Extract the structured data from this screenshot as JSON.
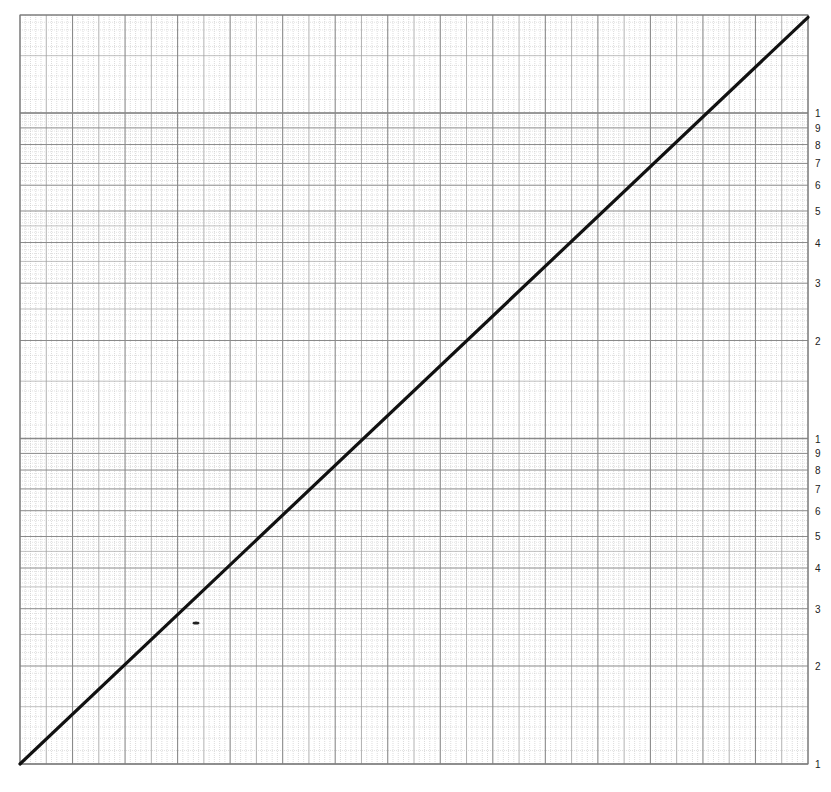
{
  "chart_data": {
    "type": "line",
    "title": "",
    "xlabel": "",
    "ylabel": "",
    "x_scale": "linear",
    "y_scale": "log",
    "grid": true,
    "legend": "none",
    "x_major_divisions": 15,
    "x_minor_per_major": 10,
    "y_cycles_full": 2,
    "y_partial_top_cycle_max": 1.97,
    "y_tick_labels": {
      "cycle_1": [
        "1",
        "2",
        "3",
        "4",
        "5",
        "6",
        "7",
        "8",
        "9",
        "1"
      ],
      "cycle_2": [
        "2",
        "3",
        "4",
        "5",
        "6",
        "7",
        "8",
        "9",
        "1"
      ]
    },
    "series": [
      {
        "name": "straight line",
        "x": [
          0,
          15
        ],
        "y_log_decades": [
          0,
          2.294
        ],
        "y": [
          1,
          196.8
        ],
        "color": "#111111"
      }
    ],
    "annotations": [
      {
        "type": "stray-mark",
        "x_px": 196,
        "y_px": 623
      }
    ]
  },
  "plot": {
    "left": 20,
    "right": 808,
    "top": 15,
    "bottom": 764,
    "cycle_height": 325.5,
    "grid_color_major": "#8a8a8a",
    "grid_color_minor": "#c4c4c4",
    "line_color": "#111111"
  },
  "labels": {
    "right_axis": [
      {
        "text": "1",
        "value": 1,
        "cycle": 0
      },
      {
        "text": "2",
        "value": 2,
        "cycle": 0
      },
      {
        "text": "3",
        "value": 3,
        "cycle": 0
      },
      {
        "text": "4",
        "value": 4,
        "cycle": 0
      },
      {
        "text": "5",
        "value": 5,
        "cycle": 0
      },
      {
        "text": "6",
        "value": 6,
        "cycle": 0
      },
      {
        "text": "7",
        "value": 7,
        "cycle": 0
      },
      {
        "text": "8",
        "value": 8,
        "cycle": 0
      },
      {
        "text": "9",
        "value": 9,
        "cycle": 0
      },
      {
        "text": "1",
        "value": 1,
        "cycle": 1
      },
      {
        "text": "2",
        "value": 2,
        "cycle": 1
      },
      {
        "text": "3",
        "value": 3,
        "cycle": 1
      },
      {
        "text": "4",
        "value": 4,
        "cycle": 1
      },
      {
        "text": "5",
        "value": 5,
        "cycle": 1
      },
      {
        "text": "6",
        "value": 6,
        "cycle": 1
      },
      {
        "text": "7",
        "value": 7,
        "cycle": 1
      },
      {
        "text": "8",
        "value": 8,
        "cycle": 1
      },
      {
        "text": "9",
        "value": 9,
        "cycle": 1
      },
      {
        "text": "1",
        "value": 1,
        "cycle": 2
      }
    ]
  }
}
